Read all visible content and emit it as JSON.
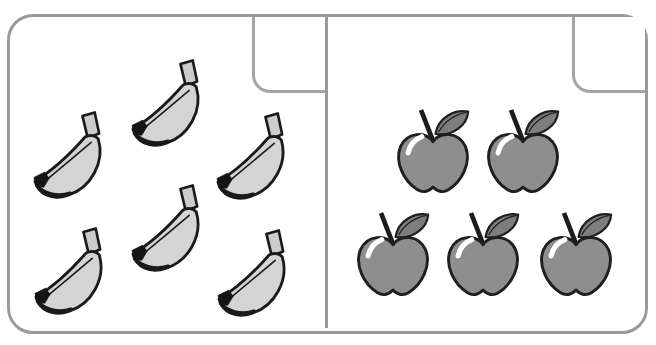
{
  "worksheet": {
    "type": "counting-exercise",
    "panels": [
      {
        "id": "left",
        "fruit": "banana",
        "count": 6,
        "answer_value": ""
      },
      {
        "id": "right",
        "fruit": "apple",
        "count": 5,
        "answer_value": ""
      }
    ]
  },
  "colors": {
    "background": "#ffffff",
    "frame_border": "#9a9a9a",
    "notch_border": "#a5a5a5",
    "banana_fill": "#d4d4d4",
    "banana_stem": "#cccccc",
    "banana_outline": "#1a1a1a",
    "banana_tip": "#141414",
    "apple_fill": "#8e8e8e",
    "apple_leaf": "#7d7d7d",
    "apple_stem": "#1c1c1c",
    "apple_outline": "#1f1f1f",
    "apple_highlight": "#ffffff"
  }
}
